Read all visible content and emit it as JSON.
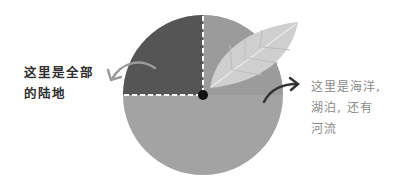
{
  "diagram": {
    "title": "",
    "circle": {
      "land_fraction": "1/4",
      "water_fraction": "3/4",
      "colors": {
        "land": "#555555",
        "water": "#a3a3a3",
        "water_upper_right": "#9b9b9b",
        "leaf": "#cfcfcf",
        "leaf_vein": "#e8e8e8",
        "divider_dash": "#ffffff",
        "center_dot": "#111111"
      }
    },
    "labels": {
      "land": {
        "lines": [
          "这里是全部",
          "的陆地"
        ],
        "color": "#2f2f2f"
      },
      "water": {
        "lines": [
          "这里是海洋,",
          "湖泊, 还有",
          "河流"
        ],
        "color": "#8a8a8a"
      }
    },
    "icons": {
      "leaf": "leaf-icon",
      "arrow_left": "curved-arrow-left-icon",
      "arrow_right": "curved-arrow-right-icon"
    }
  }
}
